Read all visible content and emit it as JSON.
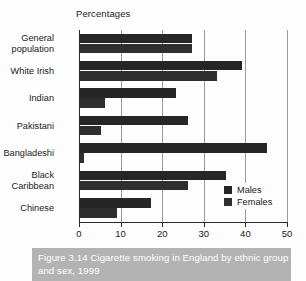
{
  "figure": {
    "axis_title": "Percentages",
    "caption": "Figure 3.14 Cigarette smoking in England by ethnic group and sex, 1999",
    "caption_band_color": "#b3b3b3",
    "background_color": "#fdfdfd"
  },
  "legend": {
    "position": "bottom-right",
    "items": [
      {
        "label": "Males",
        "color": "#262626"
      },
      {
        "label": "Females",
        "color": "#2e2e2e"
      }
    ]
  },
  "chart_data": {
    "type": "bar",
    "orientation": "horizontal",
    "title": "Figure 3.14 Cigarette smoking in England by ethnic group and sex, 1999",
    "subtitle": "Percentages",
    "xlabel": "",
    "ylabel": "",
    "xlim": [
      0,
      50
    ],
    "xticks": [
      0,
      10,
      20,
      30,
      40,
      50
    ],
    "xtick_labels": [
      "0",
      "10",
      "20",
      "30",
      "40",
      "50"
    ],
    "grid": "vertical",
    "legend_position": "bottom-right",
    "categories": [
      "General\npopulation",
      "White Irish",
      "Indian",
      "Pakistani",
      "Bangladeshi",
      "Black\nCaribbean",
      "Chinese"
    ],
    "series": [
      {
        "name": "Males",
        "color": "#262626",
        "values": [
          27,
          39,
          23,
          26,
          45,
          35,
          17
        ]
      },
      {
        "name": "Females",
        "color": "#2e2e2e",
        "values": [
          27,
          33,
          6,
          5,
          1,
          26,
          9
        ]
      }
    ]
  }
}
